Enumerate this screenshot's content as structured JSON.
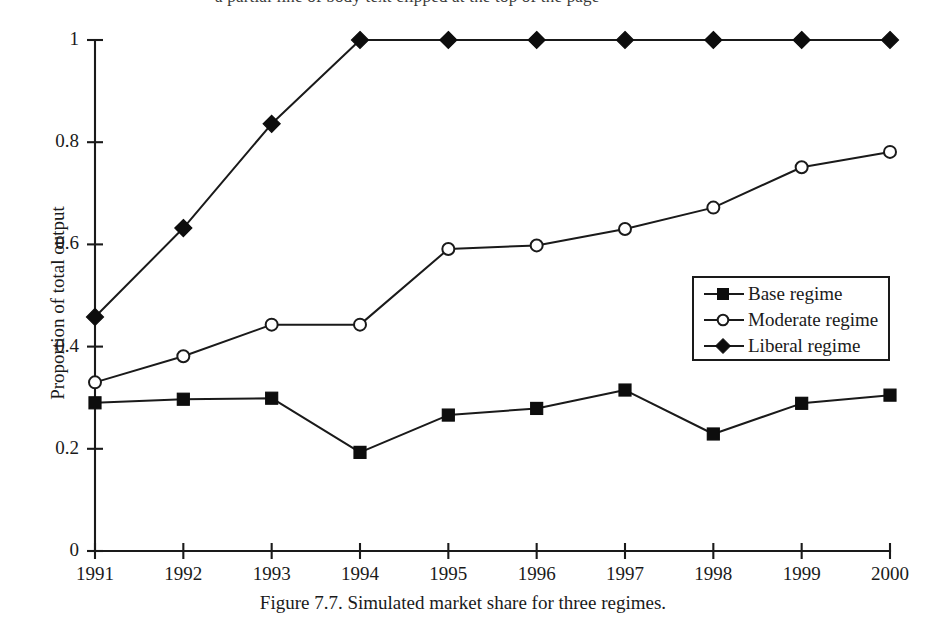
{
  "page": {
    "top_cut_text": "a partial line of body text clipped at the top of the page"
  },
  "figure": {
    "caption": "Figure 7.7.  Simulated market share for three regimes.",
    "y_axis_title": "Proportion of total output",
    "legend": {
      "items": [
        {
          "label": "Base regime",
          "marker": "filled-square"
        },
        {
          "label": "Moderate regime",
          "marker": "open-circle"
        },
        {
          "label": "Liberal regime",
          "marker": "filled-diamond"
        }
      ]
    },
    "y_tick_labels": [
      "0",
      "0.2",
      "0.4",
      "0.6",
      "0.8",
      "1"
    ],
    "x_tick_labels": [
      "1991",
      "1992",
      "1993",
      "1994",
      "1995",
      "1996",
      "1997",
      "1998",
      "1999",
      "2000"
    ],
    "colors": {
      "ink": "#1a1a1a",
      "background": "#ffffff",
      "marker_fill": "#0d0d0d",
      "marker_open_fill": "#ffffff"
    }
  },
  "chart_data": {
    "type": "line",
    "title": "Figure 7.7.  Simulated market share for three regimes.",
    "xlabel": "",
    "ylabel": "Proportion of total output",
    "categories": [
      "1991",
      "1992",
      "1993",
      "1994",
      "1995",
      "1996",
      "1997",
      "1998",
      "1999",
      "2000"
    ],
    "x": [
      1991,
      1992,
      1993,
      1994,
      1995,
      1996,
      1997,
      1998,
      1999,
      2000
    ],
    "xlim": [
      1991,
      2000
    ],
    "ylim": [
      0,
      1
    ],
    "yticks": [
      0,
      0.2,
      0.4,
      0.6,
      0.8,
      1
    ],
    "grid": false,
    "legend_position": "center-right",
    "series": [
      {
        "name": "Base regime",
        "marker": "filled-square",
        "values": [
          0.29,
          0.297,
          0.299,
          0.193,
          0.266,
          0.279,
          0.315,
          0.229,
          0.289,
          0.305
        ]
      },
      {
        "name": "Moderate regime",
        "marker": "open-circle",
        "values": [
          0.33,
          0.381,
          0.443,
          0.443,
          0.591,
          0.598,
          0.63,
          0.672,
          0.751,
          0.781
        ]
      },
      {
        "name": "Liberal regime",
        "marker": "filled-diamond",
        "values": [
          0.458,
          0.632,
          0.836,
          1.0,
          1.0,
          1.0,
          1.0,
          1.0,
          1.0,
          1.0
        ]
      }
    ]
  }
}
